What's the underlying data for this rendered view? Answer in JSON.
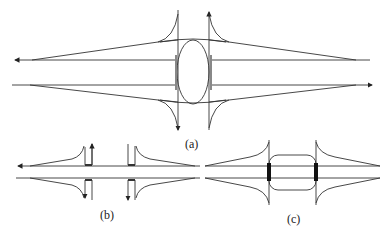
{
  "figure": {
    "panels": [
      {
        "id": "a",
        "label": "(a)",
        "description": "Oval (elliptical) interchange connecting two crossing vertical roads with diverging/merging ramps"
      },
      {
        "id": "b",
        "label": "(b)",
        "description": "Direct connection ramps with U-shaped turnarounds"
      },
      {
        "id": "c",
        "label": "(c)",
        "description": "Rounded rectangle connector between two vertical roads with thick bars"
      }
    ],
    "colors": {
      "line": "#333333",
      "thick": "#111111",
      "gray": "#888888",
      "background": "#ffffff"
    }
  }
}
